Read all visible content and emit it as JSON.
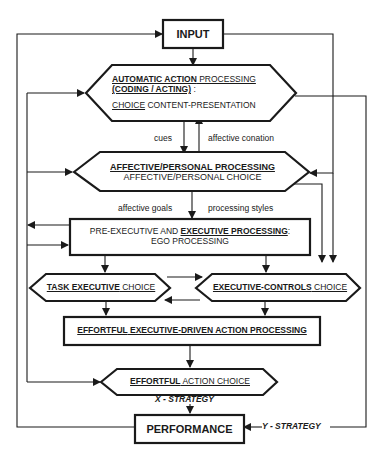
{
  "diagram": {
    "nodes": {
      "input": {
        "label": "INPUT"
      },
      "automatic": {
        "line1_bold": "AUTOMATIC ACTION",
        "line1_rest": " PROCESSING",
        "line2": "(CODING / ACTING)",
        "line2_suffix": " :",
        "line3_ul": "CHOICE",
        "line3_rest": " CONTENT-PRESENTATION"
      },
      "affective": {
        "line1": "AFFECTIVE/PERSONAL PROCESSING",
        "line2": "AFFECTIVE/PERSONAL CHOICE"
      },
      "executive": {
        "line1_pre": "PRE-EXECUTIVE AND ",
        "line1_bold": "EXECUTIVE PROCESSING",
        "line1_suffix": ":",
        "line2": "EGO PROCESSING"
      },
      "task_exec": {
        "bold": "TASK EXECUTIVE",
        "rest": " CHOICE"
      },
      "exec_controls": {
        "bold": "EXECUTIVE-CONTROLS",
        "rest": " CHOICE"
      },
      "effortful_processing": {
        "bold": "EFFORTFUL",
        "rest": " EXECUTIVE-DRIVEN ACTION PROCESSING"
      },
      "effortful_choice": {
        "bold": "EFFORTFUL",
        "rest": " ACTION CHOICE"
      },
      "performance": {
        "label": "PERFORMANCE"
      }
    },
    "edge_labels": {
      "cues": "cues",
      "affective_conation": "affective conation",
      "affective_goals": "affective goals",
      "processing_styles": "processing styles",
      "x_strategy": "X - STRATEGY",
      "y_strategy": "Y - STRATEGY"
    }
  }
}
